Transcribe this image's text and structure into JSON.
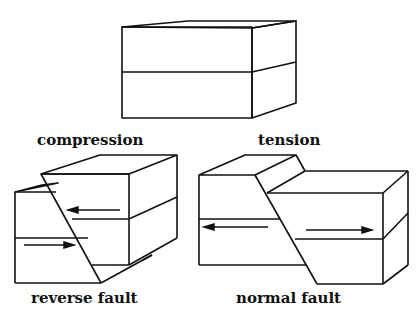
{
  "diagram": {
    "labels": {
      "compression": "compression",
      "tension": "tension",
      "reverse_fault": "reverse fault",
      "normal_fault": "normal fault"
    },
    "stroke_color": "#111111",
    "background": "#ffffff"
  }
}
